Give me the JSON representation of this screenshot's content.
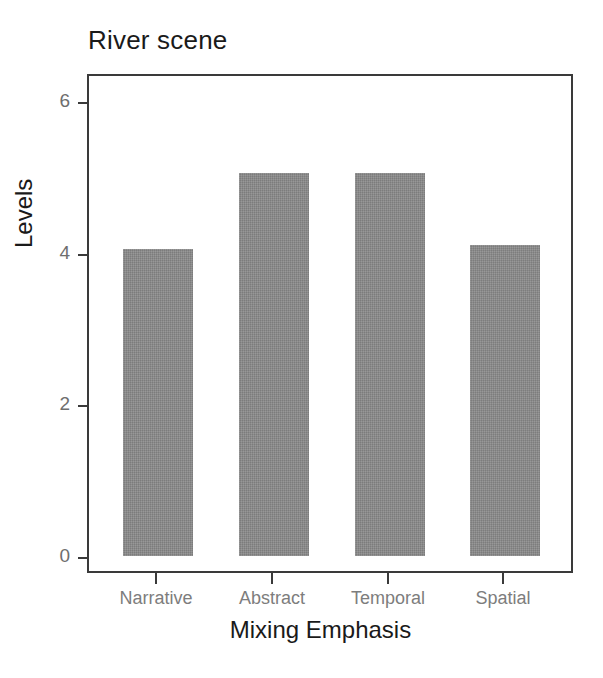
{
  "chart_data": {
    "type": "bar",
    "title": "River scene",
    "xlabel": "Mixing Emphasis",
    "ylabel": "Levels",
    "categories": [
      "Narrative",
      "Abstract",
      "Temporal",
      "Spatial"
    ],
    "values": [
      4.05,
      5.05,
      5.05,
      4.1
    ],
    "series": [
      {
        "name": "Levels",
        "values": [
          4.05,
          5.05,
          5.05,
          4.1
        ]
      }
    ],
    "ylim": [
      0,
      6.6
    ],
    "yticks": [
      0,
      2,
      4,
      6
    ],
    "ytick_labels": [
      "0",
      "2",
      "4",
      "6"
    ],
    "xtick_labels": [
      "Narrative",
      "Abstract",
      "Temporal",
      "Spatial"
    ],
    "grid": false,
    "legend": false,
    "legend_position": "none",
    "bar_color": "#8b8b8b",
    "frame_color": "#3a3a3a",
    "title_color": "#1a1a1a",
    "tick_label_color": "#7d7d7d",
    "axis_label_color": "#1a1a1a",
    "background_color": "#ffffff"
  }
}
